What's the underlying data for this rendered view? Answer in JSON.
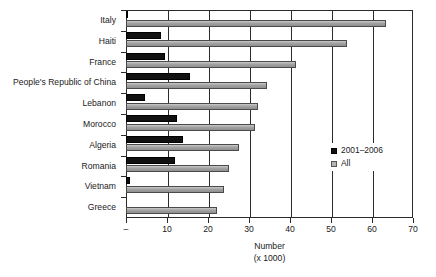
{
  "chart_data": {
    "type": "bar",
    "orientation": "horizontal",
    "title": "",
    "xlabel": "Number (x 1000)",
    "xlabel_line1": "Number",
    "xlabel_line2": "(x 1000)",
    "ylabel": "",
    "xlim": [
      0,
      70
    ],
    "xticks": [
      0,
      10,
      20,
      30,
      40,
      50,
      60,
      70
    ],
    "xticklabels": [
      "–",
      "10",
      "20",
      "30",
      "40",
      "50",
      "60",
      "70"
    ],
    "grid": true,
    "grid_axis": "x",
    "legend_position": "center-right",
    "categories": [
      "Italy",
      "Haiti",
      "France",
      "People's Republic of China",
      "Lebanon",
      "Morocco",
      "Algeria",
      "Romania",
      "Vietnam",
      "Greece"
    ],
    "series": [
      {
        "name": "2001–2006",
        "color": "#111111",
        "values": [
          0.5,
          8.5,
          9.5,
          15.7,
          4.7,
          12.5,
          14.0,
          12.0,
          1.0,
          0.0
        ]
      },
      {
        "name": "All",
        "color": "#a6a6a6",
        "values": [
          63.5,
          54.0,
          41.5,
          34.3,
          32.3,
          31.4,
          27.5,
          25.0,
          24.0,
          22.3
        ]
      }
    ]
  },
  "legend": {
    "items": [
      {
        "label": "2001–2006",
        "swatch": "black-square-icon"
      },
      {
        "label": "All",
        "swatch": "gray-square-icon"
      }
    ]
  }
}
